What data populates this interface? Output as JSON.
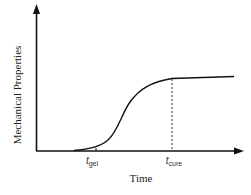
{
  "diagram": {
    "y_axis_label": "Mechanical Properties",
    "x_axis_label": "Time",
    "markers": [
      {
        "symbol": "t",
        "subscript": "gel",
        "x": 92
      },
      {
        "symbol": "t",
        "subscript": "cure",
        "x": 172
      }
    ],
    "curve": "sigmoidal rise from near zero after t_gel, leveling to a plateau at t_cure",
    "colors": {
      "line": "#111111",
      "background": "#ffffff"
    }
  }
}
